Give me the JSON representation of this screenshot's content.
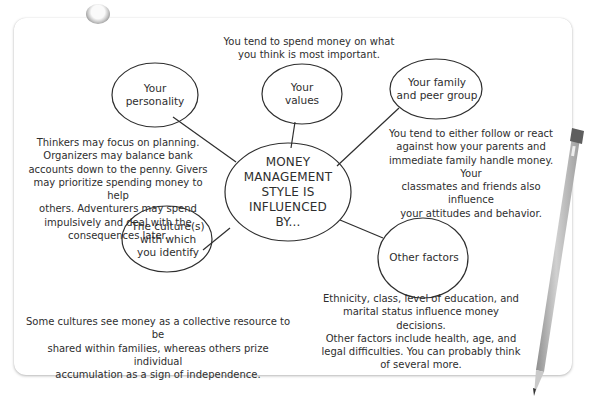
{
  "diagram": {
    "type": "mind-map",
    "center": {
      "label": "MONEY\nMANAGEMENT\nSTYLE IS\nINFLUENCED\nBY..."
    },
    "nodes": [
      {
        "id": "personality",
        "label": "Your\npersonality",
        "description": "Thinkers may focus on planning.\nOrganizers may balance bank\naccounts down to the penny. Givers\nmay prioritize spending money to help\nothers. Adventurers may spend\nimpulsively and deal with the\nconsequences later."
      },
      {
        "id": "values",
        "label": "Your\nvalues",
        "description": "You tend to spend money on what\nyou think is most important."
      },
      {
        "id": "family",
        "label": "Your family\nand peer group",
        "description": "You tend to either follow or react\nagainst how your parents and\nimmediate family handle money. Your\nclassmates and friends also influence\nyour attitudes and behavior."
      },
      {
        "id": "culture",
        "label": "The culture(s)\nwith which\nyou identify",
        "description": "Some cultures see money as a collective resource to be\nshared within families, whereas others prize individual\naccumulation as a sign of independence."
      },
      {
        "id": "other",
        "label": "Other factors",
        "description": "Ethnicity, class, level of education, and\nmarital status influence money decisions.\nOther factors include health, age, and\nlegal difficulties. You can probably think\nof several more."
      }
    ]
  },
  "colors": {
    "ink": "#2e2e2e",
    "card": "#ffffff",
    "pencil_body": "#b9b9b9",
    "pencil_dark": "#7a7a7a"
  }
}
